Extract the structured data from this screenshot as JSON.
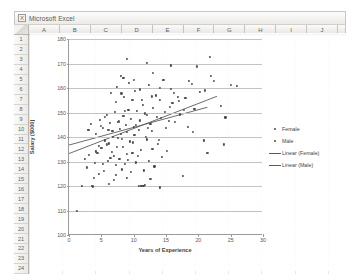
{
  "window": {
    "title": "Microsoft Excel",
    "icon": "excel-icon"
  },
  "spreadsheet": {
    "columns": [
      "A",
      "B",
      "C",
      "D",
      "E",
      "F",
      "G",
      "H",
      "I",
      "J"
    ],
    "rows": [
      "1",
      "2",
      "3",
      "4",
      "5",
      "6",
      "7",
      "8",
      "9",
      "10",
      "11",
      "12",
      "13",
      "14",
      "15",
      "16",
      "17",
      "18",
      "19",
      "20",
      "21",
      "22",
      "23",
      "24"
    ]
  },
  "legend": {
    "items": [
      {
        "label": "Female",
        "marker": "dot"
      },
      {
        "label": "Male",
        "marker": "dot"
      },
      {
        "label": "Linear (Female)",
        "marker": "line"
      },
      {
        "label": "Linear (Male)",
        "marker": "line"
      }
    ]
  },
  "chart_data": {
    "type": "scatter",
    "title": "",
    "xlabel": "Years of Experience",
    "ylabel": "Salary ($000)",
    "xlim": [
      0,
      30
    ],
    "ylim": [
      100,
      180
    ],
    "xticks": [
      0,
      5,
      10,
      15,
      20,
      25,
      30
    ],
    "yticks": [
      100,
      110,
      120,
      130,
      140,
      150,
      160,
      170,
      180
    ],
    "grid": "horizontal",
    "legend_position": "right",
    "colors": {
      "female": "#4a4a4a",
      "male": "#555555",
      "trend": "#595959"
    },
    "series": [
      {
        "name": "Female",
        "marker": "dot",
        "points": [
          [
            1.2,
            110.0
          ],
          [
            2.0,
            120.2
          ],
          [
            3.6,
            120.0
          ],
          [
            3.7,
            119.8
          ],
          [
            4.6,
            124.8
          ],
          [
            6.2,
            121.0
          ],
          [
            7.3,
            124.6
          ],
          [
            8.2,
            126.8
          ],
          [
            9.0,
            123.4
          ],
          [
            10.8,
            119.9
          ],
          [
            11.2,
            120.0
          ],
          [
            11.5,
            120.1
          ],
          [
            11.8,
            120.3
          ],
          [
            2.4,
            131.0
          ],
          [
            3.1,
            132.6
          ],
          [
            4.0,
            129.4
          ],
          [
            4.2,
            134.1
          ],
          [
            4.6,
            136.2
          ],
          [
            5.0,
            135.4
          ],
          [
            5.3,
            129.0
          ],
          [
            5.6,
            138.6
          ],
          [
            6.0,
            130.4
          ],
          [
            6.2,
            137.4
          ],
          [
            6.6,
            134.0
          ],
          [
            6.8,
            140.2
          ],
          [
            7.0,
            132.2
          ],
          [
            7.2,
            128.7
          ],
          [
            7.6,
            139.6
          ],
          [
            7.8,
            131.0
          ],
          [
            8.0,
            141.4
          ],
          [
            8.3,
            136.0
          ],
          [
            8.6,
            128.9
          ],
          [
            8.9,
            142.0
          ],
          [
            9.1,
            130.6
          ],
          [
            9.4,
            138.2
          ],
          [
            9.8,
            133.4
          ],
          [
            10.1,
            141.0
          ],
          [
            10.4,
            129.6
          ],
          [
            10.8,
            143.0
          ],
          [
            11.1,
            134.8
          ],
          [
            11.6,
            126.4
          ],
          [
            12.0,
            139.0
          ],
          [
            12.3,
            130.2
          ],
          [
            12.8,
            142.6
          ],
          [
            13.2,
            128.0
          ],
          [
            13.8,
            137.2
          ],
          [
            14.4,
            131.8
          ],
          [
            15.0,
            143.6
          ],
          [
            3.0,
            143.0
          ],
          [
            3.4,
            145.2
          ],
          [
            4.1,
            141.2
          ],
          [
            4.8,
            147.0
          ],
          [
            5.2,
            143.8
          ],
          [
            5.9,
            149.0
          ],
          [
            6.3,
            145.6
          ],
          [
            6.7,
            142.4
          ],
          [
            7.1,
            150.2
          ],
          [
            7.5,
            146.0
          ],
          [
            7.9,
            143.2
          ],
          [
            8.4,
            148.6
          ],
          [
            8.8,
            144.8
          ],
          [
            9.2,
            151.0
          ],
          [
            9.6,
            147.4
          ],
          [
            10.0,
            144.0
          ],
          [
            10.5,
            150.6
          ],
          [
            11.0,
            146.8
          ],
          [
            11.4,
            153.2
          ],
          [
            12.1,
            149.0
          ],
          [
            12.6,
            145.4
          ],
          [
            13.0,
            152.0
          ],
          [
            13.6,
            148.2
          ],
          [
            14.1,
            155.0
          ],
          [
            14.8,
            150.4
          ],
          [
            15.4,
            146.6
          ],
          [
            16.0,
            153.8
          ],
          [
            17.2,
            149.2
          ],
          [
            18.0,
            156.0
          ],
          [
            19.4,
            151.4
          ],
          [
            6.5,
            158.0
          ],
          [
            7.4,
            160.6
          ],
          [
            8.5,
            156.4
          ],
          [
            9.3,
            162.0
          ],
          [
            10.2,
            158.8
          ],
          [
            11.3,
            155.2
          ],
          [
            12.4,
            161.4
          ],
          [
            13.4,
            157.0
          ],
          [
            14.6,
            163.2
          ],
          [
            15.8,
            159.6
          ],
          [
            16.8,
            156.2
          ],
          [
            18.6,
            162.8
          ],
          [
            20.2,
            158.4
          ],
          [
            22.0,
            165.0
          ],
          [
            9.0,
            171.8
          ],
          [
            12.0,
            170.4
          ],
          [
            15.8,
            169.2
          ],
          [
            21.8,
            172.6
          ],
          [
            8.0,
            165.0
          ],
          [
            8.4,
            164.2
          ],
          [
            23.5,
            152.6
          ],
          [
            24.2,
            148.0
          ],
          [
            18.4,
            144.2
          ],
          [
            20.8,
            138.6
          ],
          [
            17.6,
            124.0
          ],
          [
            14.0,
            119.4
          ],
          [
            26.0,
            160.8
          ]
        ]
      },
      {
        "name": "Male",
        "marker": "dot",
        "points": [
          [
            2.8,
            127.6
          ],
          [
            3.9,
            123.2
          ],
          [
            5.4,
            126.0
          ],
          [
            6.9,
            122.4
          ],
          [
            9.6,
            125.8
          ],
          [
            12.6,
            123.0
          ],
          [
            4.4,
            133.4
          ],
          [
            5.8,
            137.0
          ],
          [
            6.4,
            131.6
          ],
          [
            7.4,
            135.8
          ],
          [
            8.2,
            139.2
          ],
          [
            9.0,
            133.0
          ],
          [
            9.9,
            137.8
          ],
          [
            10.6,
            132.4
          ],
          [
            11.9,
            140.0
          ],
          [
            12.9,
            135.2
          ],
          [
            13.9,
            138.8
          ],
          [
            15.2,
            134.4
          ],
          [
            4.9,
            144.6
          ],
          [
            5.5,
            148.2
          ],
          [
            6.1,
            142.8
          ],
          [
            7.7,
            146.4
          ],
          [
            8.7,
            150.8
          ],
          [
            10.3,
            145.0
          ],
          [
            11.7,
            149.6
          ],
          [
            12.2,
            143.6
          ],
          [
            14.2,
            147.8
          ],
          [
            15.6,
            152.4
          ],
          [
            16.4,
            146.2
          ],
          [
            17.8,
            151.0
          ],
          [
            7.2,
            154.4
          ],
          [
            8.1,
            157.8
          ],
          [
            9.8,
            155.0
          ],
          [
            11.0,
            159.4
          ],
          [
            12.8,
            156.6
          ],
          [
            14.0,
            160.2
          ],
          [
            16.2,
            158.0
          ],
          [
            17.0,
            154.6
          ],
          [
            19.0,
            161.6
          ],
          [
            21.0,
            159.0
          ],
          [
            10.0,
            163.4
          ],
          [
            13.0,
            166.0
          ],
          [
            19.8,
            168.8
          ],
          [
            22.4,
            163.0
          ],
          [
            25.0,
            161.2
          ],
          [
            19.2,
            142.0
          ],
          [
            21.4,
            133.4
          ],
          [
            24.0,
            137.0
          ]
        ]
      }
    ],
    "trendlines": [
      {
        "name": "Linear (Female)",
        "x1": 0.0,
        "y1": 133.0,
        "x2": 23.0,
        "y2": 156.5
      },
      {
        "name": "Linear (Male)",
        "x1": 0.0,
        "y1": 136.5,
        "x2": 21.5,
        "y2": 152.0
      }
    ]
  }
}
